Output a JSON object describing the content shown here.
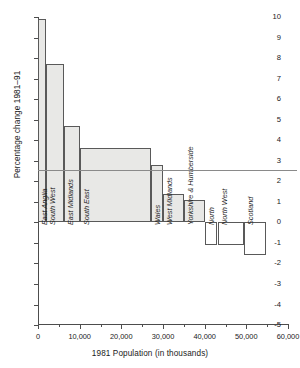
{
  "chart_data": {
    "type": "bar",
    "title": "",
    "xlabel": "1981 Population (in thousands)",
    "ylabel": "Percentage change 1981–91",
    "xlim": [
      0,
      60000
    ],
    "ylim": [
      -5,
      10
    ],
    "grid": false,
    "legend": null,
    "note": "Variable-width (mosaic) bar chart: bar width = 1981 population in thousands, bar height = percentage change 1981–91.",
    "categories": [
      "East Anglia",
      "South West",
      "East Midlands",
      "South East",
      "Wales",
      "West Midlands",
      "Yorkshire & Humberside",
      "North",
      "North West",
      "Scotland"
    ],
    "values": [
      9.9,
      7.7,
      4.7,
      3.6,
      2.8,
      1.4,
      1.1,
      -1.1,
      -1.1,
      -1.6
    ],
    "widths": [
      1890,
      4350,
      3850,
      17000,
      2800,
      5190,
      4890,
      3100,
      6400,
      5150
    ],
    "x_starts": [
      0,
      1890,
      6240,
      10090,
      27090,
      29890,
      35080,
      39970,
      43070,
      49470
    ],
    "reference_lines": [
      {
        "label": "GREAT\nBRITAIN",
        "value": 2.55
      }
    ],
    "yticks": [
      -5,
      -4,
      -3,
      -2,
      -1,
      0,
      1,
      2,
      3,
      4,
      5,
      6,
      7,
      8,
      9,
      10
    ],
    "ytick_labels": [
      "-5",
      "-4",
      "-3",
      "-2",
      "-1",
      "0",
      "1",
      "2",
      "3",
      "4",
      "5",
      "6",
      "7",
      "8",
      "9",
      "10"
    ],
    "xticks_major": [
      0,
      10000,
      20000,
      30000,
      40000,
      50000,
      60000
    ],
    "xtick_labels": [
      "0",
      "10,000",
      "20,000",
      "30,000",
      "40,000",
      "50,000",
      "60,000"
    ],
    "xticks_minor": [
      5000,
      15000,
      25000,
      35000,
      45000,
      55000
    ],
    "colors": {
      "positive_fill": "#e8e8e6",
      "negative_fill": "#ffffff",
      "bar_stroke": "#595959",
      "axis": "#4d4d4d",
      "reference_line": "#8a8a8a",
      "text": "#1a1a1a"
    }
  }
}
